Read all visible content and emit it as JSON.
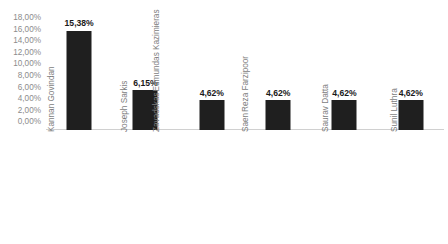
{
  "chart_data": {
    "type": "bar",
    "title": "",
    "subtitle": "",
    "xlabel": "",
    "ylabel": "",
    "categories": [
      "Kannan Govindan",
      "Joseph Sarkis",
      "Edmundas Kazimieras Zavadskas",
      "Reza Farzipoor Saen",
      "Saurav Datta",
      "Sunil Luthra"
    ],
    "category_lines": [
      [
        "Kannan Govindan"
      ],
      [
        "Joseph Sarkis"
      ],
      [
        "Edmundas Kazimieras",
        "Zavadskas"
      ],
      [
        "Reza Farzipoor",
        "Saen"
      ],
      [
        "Saurav Datta"
      ],
      [
        "Sunil Luthra"
      ]
    ],
    "values": [
      15.38,
      6.15,
      4.62,
      4.62,
      4.62,
      4.62
    ],
    "value_labels": [
      "15,38%",
      "6,15%",
      "4,62%",
      "4,62%",
      "4,62%",
      "4,62%"
    ],
    "ylim": [
      0,
      18
    ],
    "ytick_values": [
      18,
      16,
      14,
      12,
      10,
      8,
      6,
      4,
      2,
      0
    ],
    "ytick_labels": [
      "18,00%",
      "16,00%",
      "14,00%",
      "12,00%",
      "10,00%",
      "8,00%",
      "6,00%",
      "4,00%",
      "2,00%",
      "0,00%"
    ],
    "grid": false,
    "legend": false,
    "legend_position": "none",
    "bar_color": "#1f1f1f",
    "axis_color": "#d0d0d0",
    "tick_label_color": "#8c8c8c",
    "category_label_color": "#7d7d7d",
    "data_label_color": "#1a1a1a",
    "background_color": "#ffffff",
    "category_label_rotation": -90
  }
}
